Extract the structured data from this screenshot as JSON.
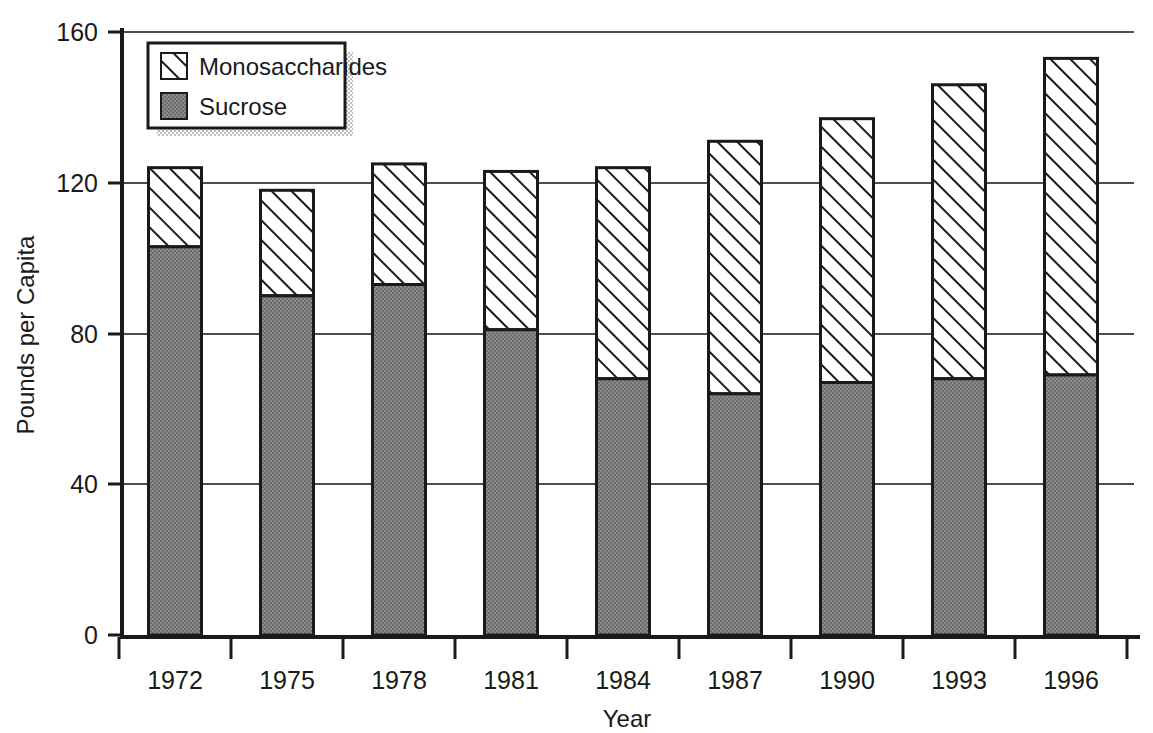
{
  "chart_data": {
    "type": "bar",
    "subtype": "stacked-vertical",
    "title": "",
    "xlabel": "Year",
    "ylabel": "Pounds per Capita",
    "categories": [
      "1972",
      "1975",
      "1978",
      "1981",
      "1984",
      "1987",
      "1990",
      "1993",
      "1996"
    ],
    "series": [
      {
        "name": "Sucrose",
        "values": [
          103,
          90,
          93,
          81,
          68,
          64,
          67,
          68,
          69
        ],
        "fill": "#808080",
        "pattern": "solid-gray"
      },
      {
        "name": "Monosaccharides",
        "values": [
          21,
          28,
          32,
          42,
          56,
          67,
          70,
          78,
          84
        ],
        "fill": "#ffffff",
        "pattern": "diagonal-hatch"
      }
    ],
    "totals": [
      124,
      118,
      125,
      123,
      124,
      131,
      137,
      146,
      153
    ],
    "ylim": [
      0,
      160
    ],
    "yticks": [
      0,
      40,
      80,
      120,
      160
    ],
    "ytick_labels": [
      "0",
      "40",
      "80",
      "120",
      "160"
    ],
    "grid": "horizontal",
    "legend_position": "top-left-inside",
    "legend_entries": [
      "Monosaccharides",
      "Sucrose"
    ]
  },
  "axes": {
    "y_title": "Pounds per Capita",
    "x_title": "Year",
    "y_ticks": [
      {
        "label": "160",
        "value": 160
      },
      {
        "label": "120",
        "value": 120
      },
      {
        "label": "80",
        "value": 80
      },
      {
        "label": "40",
        "value": 40
      },
      {
        "label": "0",
        "value": 0
      }
    ],
    "x_ticks": [
      {
        "label": "1972"
      },
      {
        "label": "1975"
      },
      {
        "label": "1978"
      },
      {
        "label": "1981"
      },
      {
        "label": "1984"
      },
      {
        "label": "1987"
      },
      {
        "label": "1990"
      },
      {
        "label": "1993"
      },
      {
        "label": "1996"
      }
    ]
  },
  "legend": {
    "items": [
      {
        "label": "Monosaccharides",
        "swatch": "hatched"
      },
      {
        "label": "Sucrose",
        "swatch": "gray"
      }
    ]
  },
  "colors": {
    "sucrose_fill": "#808080",
    "mono_fill": "#ffffff",
    "outline": "#1a1a1a",
    "gridline": "#4d4d4d",
    "background": "#ffffff",
    "legend_shadow": "#c8c8c8"
  }
}
